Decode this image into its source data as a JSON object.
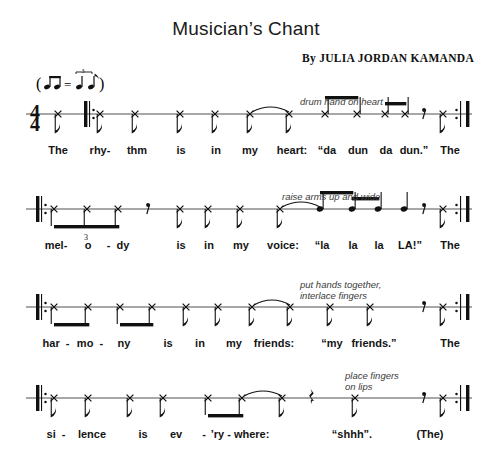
{
  "page": {
    "title": "Musician’s Chant",
    "byline": "By JULIA JORDAN KAMANDA",
    "time_signature": {
      "numerator": "4",
      "denominator": "4"
    },
    "tempo_marking": "( ♪♪ = ♪ ♪ ) swing eighths",
    "width": 492,
    "height": 465,
    "ink_color": "#111111",
    "staff_color": "#8a8a8a",
    "direction_color": "#3b3b3b"
  },
  "systems": [
    {
      "name": "system-1",
      "top": 88,
      "staff_y": 26,
      "direction": {
        "text": "drum hand on heart",
        "x": 300,
        "y": -18
      },
      "start_barline": "repeat-start",
      "end_barline": "repeat-end",
      "start_barline_x": 84,
      "end_barline_x": 466,
      "pickup": true,
      "notes": [
        {
          "x": 58,
          "head": "x",
          "stem": "down",
          "beam": null,
          "dot": false
        },
        {
          "x": 100,
          "head": "x",
          "stem": "down",
          "beam": null,
          "dot": false
        },
        {
          "x": 135,
          "head": "x",
          "stem": "down",
          "beam": null,
          "dot": false
        },
        {
          "x": 180,
          "head": "x",
          "stem": "down",
          "beam": null,
          "dot": false
        },
        {
          "x": 215,
          "head": "x",
          "stem": "down",
          "beam": null,
          "dot": false
        },
        {
          "x": 250,
          "head": "x",
          "stem": "down",
          "beam": null,
          "dot": false
        },
        {
          "x": 289,
          "head": "x",
          "stem": "down",
          "beam": null,
          "dot": false
        },
        {
          "x": 325,
          "head": "x",
          "stem": "up",
          "beam": "b1",
          "dot": false
        },
        {
          "x": 357,
          "head": "x",
          "stem": "up",
          "beam": "b1",
          "dot": false
        },
        {
          "x": 385,
          "head": "x",
          "stem": "up",
          "beam": "b2",
          "dot": false
        },
        {
          "x": 405,
          "head": "x",
          "stem": "up",
          "beam": "b2",
          "dot": false
        },
        {
          "x": 443,
          "head": "x",
          "stem": "down",
          "beam": null,
          "dot": false
        }
      ],
      "beams": [
        {
          "id": "b1",
          "x1": 325,
          "x2": 357,
          "y": -18,
          "thick": true
        },
        {
          "id": "b2",
          "x1": 385,
          "x2": 405,
          "y": -12,
          "thick": true
        }
      ],
      "rests": [
        {
          "x": 424,
          "type": "eighth"
        }
      ],
      "ties": [
        {
          "x1": 252,
          "x2": 289,
          "y": -6
        }
      ],
      "lyrics": [
        {
          "x": 58,
          "text": "The"
        },
        {
          "x": 100,
          "text": "rhy-"
        },
        {
          "x": 137,
          "text": "thm"
        },
        {
          "x": 181,
          "text": "is"
        },
        {
          "x": 216,
          "text": "in"
        },
        {
          "x": 250,
          "text": "my"
        },
        {
          "x": 292,
          "text": "heart:"
        },
        {
          "x": 327,
          "text": "“da"
        },
        {
          "x": 358,
          "text": "dun"
        },
        {
          "x": 386,
          "text": "da"
        },
        {
          "x": 414,
          "text": "dun.”"
        },
        {
          "x": 450,
          "text": "The"
        }
      ]
    },
    {
      "name": "system-2",
      "top": 183,
      "staff_y": 26,
      "direction": {
        "text": "raise arms up and wide",
        "x": 282,
        "y": -18
      },
      "start_barline": "repeat-start",
      "end_barline": "repeat-end",
      "start_barline_x": 36,
      "end_barline_x": 466,
      "pickup": false,
      "tuplet": {
        "x1": 52,
        "x2": 120,
        "label": "3"
      },
      "notes": [
        {
          "x": 54,
          "head": "x",
          "stem": "down",
          "beam": "t1",
          "dot": false
        },
        {
          "x": 87,
          "head": "x",
          "stem": "down",
          "beam": "t1",
          "dot": false
        },
        {
          "x": 118,
          "head": "x",
          "stem": "down",
          "beam": "t1",
          "dot": false
        },
        {
          "x": 180,
          "head": "x",
          "stem": "down",
          "beam": null,
          "dot": false
        },
        {
          "x": 208,
          "head": "x",
          "stem": "down",
          "beam": null,
          "dot": false
        },
        {
          "x": 240,
          "head": "x",
          "stem": "down",
          "beam": null,
          "dot": false
        },
        {
          "x": 280,
          "head": "x",
          "stem": "down",
          "beam": null,
          "dot": false
        },
        {
          "x": 320,
          "head": "round",
          "stem": "up",
          "beam": "b3",
          "dot": false
        },
        {
          "x": 352,
          "head": "round",
          "stem": "up",
          "beam": "b4",
          "dot": false
        },
        {
          "x": 378,
          "head": "round",
          "stem": "up",
          "beam": "b4",
          "dot": false
        },
        {
          "x": 404,
          "head": "round",
          "stem": "up",
          "beam": null,
          "dot": false
        },
        {
          "x": 443,
          "head": "x",
          "stem": "down",
          "beam": null,
          "dot": false
        }
      ],
      "beams": [
        {
          "id": "t1",
          "x1": 54,
          "x2": 118,
          "y": 16,
          "thick": true
        },
        {
          "id": "b3",
          "x1": 320,
          "x2": 352,
          "y": -18,
          "thick": true
        },
        {
          "id": "b4",
          "x1": 352,
          "x2": 378,
          "y": -12,
          "thick": true
        }
      ],
      "rests": [
        {
          "x": 148,
          "type": "eighth"
        },
        {
          "x": 424,
          "type": "eighth"
        }
      ],
      "ties": [
        {
          "x1": 282,
          "x2": 320,
          "y": -6
        }
      ],
      "lyrics": [
        {
          "x": 56,
          "text": "mel-"
        },
        {
          "x": 88,
          "text": "o"
        },
        {
          "x": 118,
          "text": "-  dy"
        },
        {
          "x": 181,
          "text": "is"
        },
        {
          "x": 209,
          "text": "in"
        },
        {
          "x": 241,
          "text": "my"
        },
        {
          "x": 283,
          "text": "voice:"
        },
        {
          "x": 322,
          "text": "“la"
        },
        {
          "x": 353,
          "text": "la"
        },
        {
          "x": 379,
          "text": "la"
        },
        {
          "x": 410,
          "text": "LA!”"
        },
        {
          "x": 450,
          "text": "The"
        }
      ]
    },
    {
      "name": "system-3",
      "top": 281,
      "staff_y": 26,
      "direction": {
        "text": "put hands together,\ninterlace fingers",
        "x": 300,
        "y": -28
      },
      "start_barline": "repeat-start",
      "end_barline": "repeat-end",
      "start_barline_x": 36,
      "end_barline_x": 466,
      "pickup": false,
      "notes": [
        {
          "x": 54,
          "head": "x",
          "stem": "down",
          "beam": "b5",
          "dot": false
        },
        {
          "x": 88,
          "head": "x",
          "stem": "down",
          "beam": "b5",
          "dot": false
        },
        {
          "x": 120,
          "head": "x",
          "stem": "down",
          "beam": "b6",
          "dot": false
        },
        {
          "x": 152,
          "head": "x",
          "stem": "down",
          "beam": "b6",
          "dot": false
        },
        {
          "x": 186,
          "head": "x",
          "stem": "down",
          "beam": null,
          "dot": false
        },
        {
          "x": 218,
          "head": "x",
          "stem": "down",
          "beam": null,
          "dot": false
        },
        {
          "x": 252,
          "head": "x",
          "stem": "down",
          "beam": null,
          "dot": false
        },
        {
          "x": 290,
          "head": "x",
          "stem": "down",
          "beam": null,
          "dot": false
        },
        {
          "x": 330,
          "head": "x",
          "stem": "down",
          "beam": null,
          "dot": false
        },
        {
          "x": 370,
          "head": "x",
          "stem": "down",
          "beam": null,
          "dot": false
        },
        {
          "x": 443,
          "head": "x",
          "stem": "down",
          "beam": null,
          "dot": false
        }
      ],
      "beams": [
        {
          "id": "b5",
          "x1": 54,
          "x2": 88,
          "y": 16,
          "thick": true
        },
        {
          "id": "b6",
          "x1": 120,
          "x2": 152,
          "y": 16,
          "thick": true
        }
      ],
      "rests": [
        {
          "x": 424,
          "type": "eighth"
        }
      ],
      "ties": [
        {
          "x1": 254,
          "x2": 290,
          "y": -6
        }
      ],
      "lyrics": [
        {
          "x": 56,
          "text": "har  -"
        },
        {
          "x": 90,
          "text": "mo  -"
        },
        {
          "x": 124,
          "text": "ny"
        },
        {
          "x": 168,
          "text": "is"
        },
        {
          "x": 200,
          "text": "in"
        },
        {
          "x": 234,
          "text": "my"
        },
        {
          "x": 274,
          "text": "friends:"
        },
        {
          "x": 332,
          "text": "“my"
        },
        {
          "x": 374,
          "text": "friends.”"
        },
        {
          "x": 450,
          "text": "The"
        }
      ]
    },
    {
      "name": "system-4",
      "top": 372,
      "staff_y": 26,
      "direction": {
        "text": "place fingers\non lips",
        "x": 345,
        "y": -28
      },
      "start_barline": "repeat-start",
      "end_barline": "repeat-end",
      "start_barline_x": 36,
      "end_barline_x": 466,
      "pickup": false,
      "notes": [
        {
          "x": 54,
          "head": "x",
          "stem": "down",
          "beam": null,
          "dot": false
        },
        {
          "x": 88,
          "head": "x",
          "stem": "down",
          "beam": null,
          "dot": false
        },
        {
          "x": 130,
          "head": "x",
          "stem": "down",
          "beam": null,
          "dot": false
        },
        {
          "x": 163,
          "head": "x",
          "stem": "down",
          "beam": null,
          "dot": false
        },
        {
          "x": 208,
          "head": "x",
          "stem": "down",
          "beam": "b7",
          "dot": false
        },
        {
          "x": 242,
          "head": "x",
          "stem": "down",
          "beam": "b7",
          "dot": false
        },
        {
          "x": 282,
          "head": "x",
          "stem": "down",
          "beam": null,
          "dot": false
        },
        {
          "x": 355,
          "head": "x",
          "stem": "down",
          "beam": null,
          "dot": false
        },
        {
          "x": 443,
          "head": "x",
          "stem": "down",
          "beam": null,
          "dot": false
        }
      ],
      "beams": [
        {
          "id": "b7",
          "x1": 208,
          "x2": 242,
          "y": 16,
          "thick": true
        }
      ],
      "rests": [
        {
          "x": 312,
          "type": "quarter"
        },
        {
          "x": 424,
          "type": "eighth"
        }
      ],
      "ties": [
        {
          "x1": 244,
          "x2": 282,
          "y": -6
        }
      ],
      "lyrics": [
        {
          "x": 56,
          "text": "si  -"
        },
        {
          "x": 92,
          "text": "lence"
        },
        {
          "x": 143,
          "text": "is"
        },
        {
          "x": 176,
          "text": "ev"
        },
        {
          "x": 204,
          "text": "-"
        },
        {
          "x": 240,
          "text": "’ry - where:"
        },
        {
          "x": 352,
          "text": "“shhh”."
        },
        {
          "x": 430,
          "text": "(The)"
        }
      ]
    }
  ]
}
